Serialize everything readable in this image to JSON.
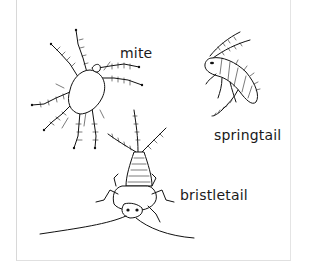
{
  "illustration": {
    "subject": "soil arthropods line drawing",
    "labels": {
      "mite": "mite",
      "springtail": "springtail",
      "bristletail": "bristletail"
    }
  }
}
